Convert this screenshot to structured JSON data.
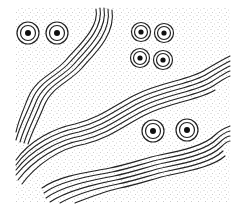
{
  "illustration": {
    "description": "Aboriginal-style dot painting with concentric circle motifs and wavy line bands",
    "background_color": "#ffffff",
    "ink_color": "#222222",
    "dot_color": "#8a8a8a",
    "field": {
      "x": 16,
      "y": 8,
      "width": 214,
      "height": 194
    },
    "circle_groups": [
      {
        "name": "top-left-pair",
        "circles": [
          {
            "cx": 28,
            "cy": 33
          },
          {
            "cx": 57,
            "cy": 33
          }
        ]
      },
      {
        "name": "top-right-quad",
        "circles": [
          {
            "cx": 141,
            "cy": 32
          },
          {
            "cx": 164,
            "cy": 33
          },
          {
            "cx": 140,
            "cy": 58
          },
          {
            "cx": 163,
            "cy": 60
          }
        ]
      },
      {
        "name": "bottom-right-pair",
        "circles": [
          {
            "cx": 153,
            "cy": 131
          },
          {
            "cx": 187,
            "cy": 130
          }
        ]
      }
    ],
    "bands": [
      {
        "name": "top-left-band",
        "line_count": 5
      },
      {
        "name": "middle-band",
        "line_count": 6
      },
      {
        "name": "bottom-band",
        "line_count": 6
      }
    ]
  }
}
